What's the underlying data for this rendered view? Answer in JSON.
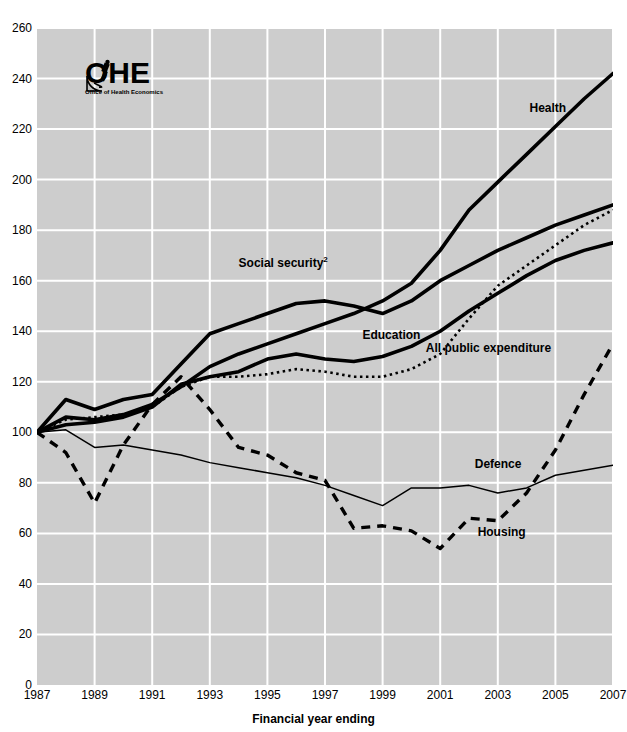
{
  "chart_data": {
    "type": "line",
    "title": "",
    "xlabel": "Financial year ending",
    "ylabel": "",
    "xlim": [
      1987,
      2007
    ],
    "ylim": [
      0,
      260
    ],
    "ytick_step": 20,
    "xtick_step": 2,
    "grid": true,
    "legend": "inline-labels",
    "background_color": "#cdcdcd",
    "gridline_color": "#ffffff",
    "line_color": "#000000",
    "x": [
      1987,
      1988,
      1989,
      1990,
      1991,
      1992,
      1993,
      1994,
      1995,
      1996,
      1997,
      1998,
      1999,
      2000,
      2001,
      2002,
      2003,
      2004,
      2005,
      2006,
      2007
    ],
    "yticks": [
      0,
      20,
      40,
      60,
      80,
      100,
      120,
      140,
      160,
      180,
      200,
      220,
      240,
      260
    ],
    "xticks": [
      1987,
      1989,
      1991,
      1993,
      1995,
      1997,
      1999,
      2001,
      2003,
      2005,
      2007
    ],
    "series": [
      {
        "name": "Health",
        "style": "thick-solid",
        "label": "Health",
        "label_x": 2004.1,
        "label_y": 228,
        "values": [
          100,
          106,
          105,
          107,
          111,
          118,
          126,
          131,
          135,
          139,
          143,
          147,
          152,
          159,
          172,
          188,
          199,
          210,
          221,
          232,
          242
        ]
      },
      {
        "name": "Social security2",
        "style": "thick-solid",
        "label": "Social security",
        "label_sup": "2",
        "label_x": 1994.0,
        "label_y": 167,
        "values": [
          100,
          113,
          109,
          113,
          115,
          127,
          139,
          143,
          147,
          151,
          152,
          150,
          147,
          152,
          160,
          166,
          172,
          177,
          182,
          186,
          190
        ]
      },
      {
        "name": "Education",
        "style": "thick-solid",
        "label": "Education",
        "label_x": 1998.3,
        "label_y": 138,
        "values": [
          100,
          103,
          104,
          106,
          110,
          119,
          122,
          124,
          129,
          131,
          129,
          128,
          130,
          134,
          140,
          148,
          155,
          162,
          168,
          172,
          175
        ]
      },
      {
        "name": "All public expenditure",
        "style": "dotted",
        "label": "All public expenditure",
        "label_x": 2000.5,
        "label_y": 133,
        "values": [
          100,
          105,
          106,
          107,
          110,
          118,
          122,
          122,
          123,
          125,
          124,
          122,
          122,
          125,
          131,
          145,
          158,
          166,
          174,
          182,
          188
        ]
      },
      {
        "name": "Defence",
        "style": "thin-solid",
        "label": "Defence",
        "label_x": 2002.2,
        "label_y": 87,
        "values": [
          100,
          101,
          94,
          95,
          93,
          91,
          88,
          86,
          84,
          82,
          79,
          75,
          71,
          78,
          78,
          79,
          76,
          78,
          83,
          85,
          87
        ]
      },
      {
        "name": "Housing",
        "style": "dashed",
        "label": "Housing",
        "label_x": 2002.3,
        "label_y": 60,
        "values": [
          100,
          92,
          72,
          95,
          111,
          122,
          109,
          94,
          91,
          84,
          81,
          62,
          63,
          61,
          54,
          66,
          65,
          76,
          93,
          115,
          135
        ]
      }
    ]
  },
  "logo": {
    "text": "OHE",
    "subtitle": "Office of Health Economics",
    "mark": "microscope-icon"
  },
  "axis": {
    "x_title": "Financial year ending"
  }
}
